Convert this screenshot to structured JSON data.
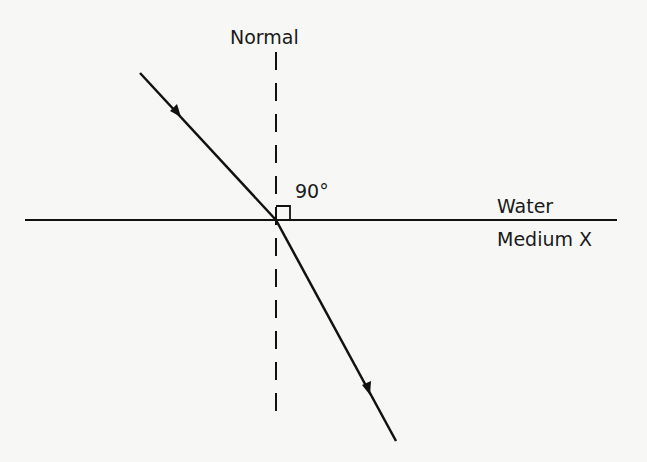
{
  "diagram": {
    "labels": {
      "normal": "Normal",
      "angle": "90°",
      "top_medium": "Water",
      "bottom_medium": "Medium X"
    },
    "elements": {
      "boundary": {
        "x1": 25,
        "y1": 220,
        "x2": 617,
        "y2": 220
      },
      "normal_line": {
        "x": 276,
        "y1": 52,
        "y2": 418,
        "style": "dashed"
      },
      "incident_ray": {
        "x1": 140,
        "y1": 73,
        "x2": 276,
        "y2": 220,
        "arrow_at": [
          176,
          111
        ]
      },
      "refracted_ray": {
        "x1": 276,
        "y1": 220,
        "x2": 396,
        "y2": 441,
        "arrow_at": [
          367,
          389
        ]
      },
      "right_angle_marker": {
        "x": 276,
        "y": 206,
        "size": 14
      }
    },
    "colors": {
      "line": "#111111",
      "background": "#f7f7f5"
    }
  }
}
